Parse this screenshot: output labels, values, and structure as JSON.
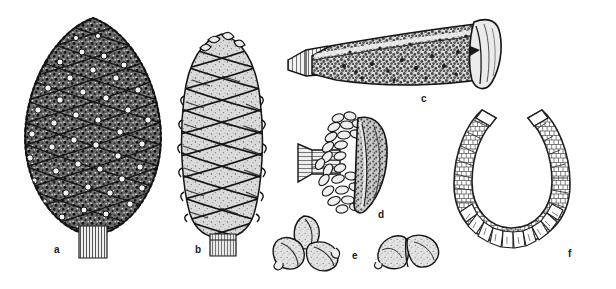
{
  "plate": {
    "title": "Pine cone and seed morphology plate",
    "background_color": "#ffffff",
    "ink_color": "#1a1a1a",
    "width": 616,
    "height": 289
  },
  "figures": [
    {
      "key": "a",
      "label": "a",
      "name": "mature-closed-cone-dark",
      "description": "Large ovoid mature closed cone, dark heavily stippled scales with raised umbos, short woody peduncle",
      "label_x": 57,
      "label_y": 250,
      "tone": "dark"
    },
    {
      "key": "b",
      "label": "b",
      "name": "mature-closed-cone-light",
      "description": "Narrower elongate cone, light rhombic apophyses in spiral ranks, short stalk",
      "label_x": 198,
      "label_y": 250,
      "tone": "light"
    },
    {
      "key": "c",
      "label": "c",
      "name": "cone-scale-lateral-view",
      "description": "Cone scale seen in lateral view, elongate tapering claw with granular surface and flared apophysis at right",
      "label_x": 424,
      "label_y": 99,
      "tone": "medium"
    },
    {
      "key": "d",
      "label": "d",
      "name": "cone-scale-adaxial-with-seeds",
      "description": "Cone scale with columnar stalk, ring of ovules or seed bodies, and shield-shaped apophysis",
      "label_x": 381,
      "label_y": 216,
      "tone": "medium"
    },
    {
      "key": "e",
      "label": "e",
      "name": "seeds",
      "description": "Seeds: a cluster of three seeds at left and a pair of seeds at right",
      "label_x": 355,
      "label_y": 257,
      "tone": "light"
    },
    {
      "key": "f",
      "label": "f",
      "name": "cone-cross-section-ring",
      "description": "Horseshoe shaped cross section of cone axis with radiating scale bases, opening upward",
      "label_x": 571,
      "label_y": 255,
      "tone": "outline"
    }
  ]
}
